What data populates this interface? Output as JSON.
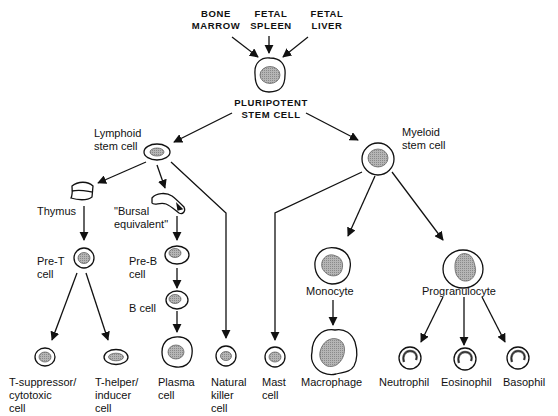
{
  "sources": {
    "bone_marrow": "BONE\nMARROW",
    "fetal_spleen": "FETAL\nSPLEEN",
    "fetal_liver": "FETAL\nLIVER"
  },
  "nodes": {
    "pluripotent": "PLURIPOTENT\nSTEM CELL",
    "lymphoid": "Lymphoid\nstem cell",
    "myeloid": "Myeloid\nstem cell",
    "thymus": "Thymus",
    "bursal": "\"Bursal\nequivalent\"",
    "pre_t": "Pre-T\ncell",
    "pre_b": "Pre-B\ncell",
    "b_cell": "B cell",
    "t_suppressor": "T-suppressor/\ncytotoxic\ncell",
    "t_helper": "T-helper/\ninducer\ncell",
    "plasma": "Plasma\ncell",
    "natural_killer": "Natural\nkiller\ncell",
    "mast": "Mast\ncell",
    "monocyte": "Monocyte",
    "macrophage": "Macrophage",
    "progranulocyte": "Progranulocyte",
    "neutrophil": "Neutrophil",
    "eosinophil": "Eosinophil",
    "basophil": "Basophil"
  },
  "edges": [
    [
      "bone_marrow",
      "pluripotent"
    ],
    [
      "fetal_spleen",
      "pluripotent"
    ],
    [
      "fetal_liver",
      "pluripotent"
    ],
    [
      "pluripotent",
      "lymphoid"
    ],
    [
      "pluripotent",
      "myeloid"
    ],
    [
      "lymphoid",
      "thymus"
    ],
    [
      "lymphoid",
      "bursal"
    ],
    [
      "lymphoid",
      "natural_killer"
    ],
    [
      "thymus",
      "pre_t"
    ],
    [
      "bursal",
      "pre_b"
    ],
    [
      "pre_b",
      "b_cell"
    ],
    [
      "b_cell",
      "plasma"
    ],
    [
      "pre_t",
      "t_suppressor"
    ],
    [
      "pre_t",
      "t_helper"
    ],
    [
      "myeloid",
      "mast"
    ],
    [
      "myeloid",
      "monocyte"
    ],
    [
      "myeloid",
      "progranulocyte"
    ],
    [
      "monocyte",
      "macrophage"
    ],
    [
      "progranulocyte",
      "neutrophil"
    ],
    [
      "progranulocyte",
      "eosinophil"
    ],
    [
      "progranulocyte",
      "basophil"
    ]
  ]
}
